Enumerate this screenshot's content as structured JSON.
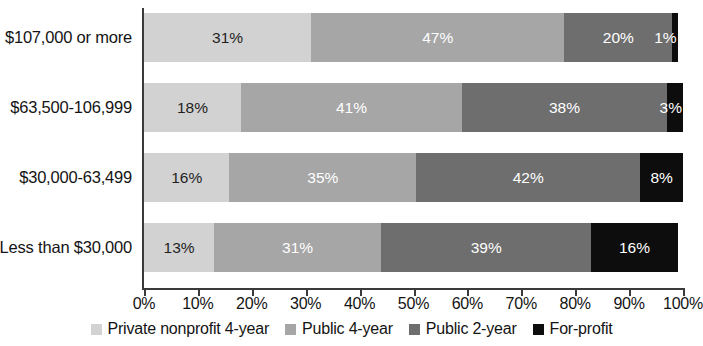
{
  "chart_data": {
    "type": "bar",
    "orientation": "horizontal",
    "stacked": true,
    "stacked_percent": true,
    "title": "",
    "subtitle": "",
    "xlabel": "",
    "ylabel": "",
    "xlim": [
      0,
      100
    ],
    "grid": false,
    "legend_position": "bottom",
    "categories": [
      "Less than $30,000",
      "$30,000-63,499",
      "$63,500-106,999",
      "$107,000 or more"
    ],
    "categories_top_to_bottom": [
      "$107,000 or more",
      "$63,500-106,999",
      "$30,000-63,499",
      "Less than $30,000"
    ],
    "series": [
      {
        "name": "Private nonprofit 4-year",
        "color": "#d2d2d2",
        "label_color": "#1f1f1f",
        "values_top_to_bottom": [
          31,
          18,
          16,
          13
        ],
        "value_labels_top_to_bottom": [
          "31%",
          "18%",
          "16%",
          "13%"
        ]
      },
      {
        "name": "Public 4-year",
        "color": "#a6a6a6",
        "label_color": "#ffffff",
        "values_top_to_bottom": [
          47,
          41,
          35,
          31
        ],
        "value_labels_top_to_bottom": [
          "47%",
          "41%",
          "35%",
          "31%"
        ]
      },
      {
        "name": "Public 2-year",
        "color": "#6e6e6e",
        "label_color": "#ffffff",
        "values_top_to_bottom": [
          20,
          38,
          42,
          39
        ],
        "value_labels_top_to_bottom": [
          "20%",
          "38%",
          "42%",
          "39%"
        ]
      },
      {
        "name": "For-profit",
        "color": "#0d0d0d",
        "label_color": "#ffffff",
        "values_top_to_bottom": [
          1,
          3,
          8,
          16
        ],
        "value_labels_top_to_bottom": [
          "1%",
          "3%",
          "8%",
          "16%"
        ]
      }
    ],
    "xticks": [
      0,
      10,
      20,
      30,
      40,
      50,
      60,
      70,
      80,
      90,
      100
    ],
    "xtick_labels": [
      "0%",
      "10%",
      "20%",
      "30%",
      "40%",
      "50%",
      "60%",
      "70%",
      "80%",
      "90%",
      "100%"
    ]
  },
  "axes": {
    "category_labels": [
      "$107,000 or more",
      "$63,500-106,999",
      "$30,000-63,499",
      "Less than $30,000"
    ],
    "x_tick_labels": [
      "0%",
      "10%",
      "20%",
      "30%",
      "40%",
      "50%",
      "60%",
      "70%",
      "80%",
      "90%",
      "100%"
    ]
  },
  "bars": [
    {
      "category": "$107,000 or more",
      "segments": [
        {
          "series": "Private nonprofit 4-year",
          "value": 31,
          "label": "31%",
          "color": "#d2d2d2",
          "label_color": "dark"
        },
        {
          "series": "Public 4-year",
          "value": 47,
          "label": "47%",
          "color": "#a6a6a6",
          "label_color": "light"
        },
        {
          "series": "Public 2-year",
          "value": 20,
          "label": "20%",
          "color": "#6e6e6e",
          "label_color": "light"
        },
        {
          "series": "For-profit",
          "value": 1,
          "label": "1%",
          "color": "#0d0d0d",
          "label_color": "light"
        }
      ]
    },
    {
      "category": "$63,500-106,999",
      "segments": [
        {
          "series": "Private nonprofit 4-year",
          "value": 18,
          "label": "18%",
          "color": "#d2d2d2",
          "label_color": "dark"
        },
        {
          "series": "Public 4-year",
          "value": 41,
          "label": "41%",
          "color": "#a6a6a6",
          "label_color": "light"
        },
        {
          "series": "Public 2-year",
          "value": 38,
          "label": "38%",
          "color": "#6e6e6e",
          "label_color": "light"
        },
        {
          "series": "For-profit",
          "value": 3,
          "label": "3%",
          "color": "#0d0d0d",
          "label_color": "light"
        }
      ]
    },
    {
      "category": "$30,000-63,499",
      "segments": [
        {
          "series": "Private nonprofit 4-year",
          "value": 16,
          "label": "16%",
          "color": "#d2d2d2",
          "label_color": "dark"
        },
        {
          "series": "Public 4-year",
          "value": 35,
          "label": "35%",
          "color": "#a6a6a6",
          "label_color": "light"
        },
        {
          "series": "Public 2-year",
          "value": 42,
          "label": "42%",
          "color": "#6e6e6e",
          "label_color": "light"
        },
        {
          "series": "For-profit",
          "value": 8,
          "label": "8%",
          "color": "#0d0d0d",
          "label_color": "light"
        }
      ]
    },
    {
      "category": "Less than $30,000",
      "segments": [
        {
          "series": "Private nonprofit 4-year",
          "value": 13,
          "label": "13%",
          "color": "#d2d2d2",
          "label_color": "dark"
        },
        {
          "series": "Public 4-year",
          "value": 31,
          "label": "31%",
          "color": "#a6a6a6",
          "label_color": "light"
        },
        {
          "series": "Public 2-year",
          "value": 39,
          "label": "39%",
          "color": "#6e6e6e",
          "label_color": "light"
        },
        {
          "series": "For-profit",
          "value": 16,
          "label": "16%",
          "color": "#0d0d0d",
          "label_color": "light"
        }
      ]
    }
  ],
  "legend": {
    "items": [
      {
        "label": "Private nonprofit 4-year",
        "color": "#d2d2d2"
      },
      {
        "label": "Public 4-year",
        "color": "#a6a6a6"
      },
      {
        "label": "Public 2-year",
        "color": "#6e6e6e"
      },
      {
        "label": "For-profit",
        "color": "#0d0d0d"
      }
    ]
  }
}
